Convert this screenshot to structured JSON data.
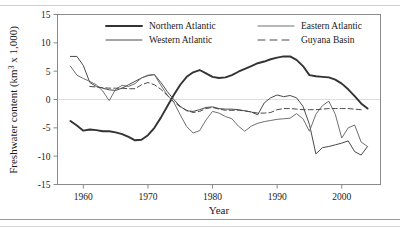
{
  "figure": {
    "axis_titles": {
      "x": "Year",
      "y_full": "Freshwater content (km3 x 1,000)",
      "y_pre": "Freshwater content (km",
      "y_sup": "3",
      "y_post": " x 1,000)"
    }
  },
  "chart_data": {
    "type": "line",
    "title": "",
    "xlabel": "Year",
    "ylabel": "Freshwater content (km3 x 1,000)",
    "xlim": [
      1956,
      2006
    ],
    "ylim": [
      -15,
      15
    ],
    "xticks": [
      1960,
      1970,
      1980,
      1990,
      2000
    ],
    "xtick_labels": [
      "1960",
      "1970",
      "1980",
      "1990",
      "2000"
    ],
    "yticks": [
      15,
      10,
      5,
      0,
      -5,
      -10,
      -15
    ],
    "ytick_labels": [
      "15",
      "10",
      "5",
      "0",
      "-5",
      "-10",
      "-15"
    ],
    "grid": "zero-line-only",
    "legend_position": "top-inside-two-columns",
    "series": [
      {
        "name": "Northern Atlantic",
        "style": "solid",
        "color": "#333333",
        "width": 1.9,
        "x": [
          1958,
          1959,
          1960,
          1961,
          1962,
          1963,
          1964,
          1965,
          1966,
          1967,
          1968,
          1969,
          1970,
          1971,
          1972,
          1973,
          1974,
          1975,
          1976,
          1977,
          1978,
          1979,
          1980,
          1981,
          1982,
          1983,
          1984,
          1985,
          1986,
          1987,
          1988,
          1989,
          1990,
          1991,
          1992,
          1993,
          1994,
          1995,
          1996,
          1997,
          1998,
          1999,
          2000,
          2001,
          2002,
          2003,
          2004
        ],
        "y": [
          -3.8,
          -4.6,
          -5.5,
          -5.3,
          -5.4,
          -5.6,
          -5.6,
          -5.8,
          -6.1,
          -6.6,
          -7.2,
          -7.1,
          -6.3,
          -5.0,
          -3.2,
          -1.2,
          0.8,
          2.6,
          4.0,
          4.8,
          5.2,
          4.6,
          4.0,
          3.8,
          3.9,
          4.3,
          4.9,
          5.4,
          5.9,
          6.4,
          6.7,
          7.1,
          7.4,
          7.6,
          7.6,
          7.0,
          5.9,
          4.3,
          4.1,
          4.0,
          3.9,
          3.5,
          2.8,
          1.8,
          0.6,
          -0.7,
          -1.6
        ]
      },
      {
        "name": "Western Atlantic",
        "style": "solid",
        "color": "#4a4a4a",
        "width": 1.0,
        "x": [
          1958,
          1959,
          1960,
          1961,
          1962,
          1963,
          1964,
          1965,
          1966,
          1967,
          1968,
          1969,
          1970,
          1971,
          1972,
          1973,
          1974,
          1975,
          1976,
          1977,
          1978,
          1979,
          1980,
          1981,
          1982,
          1983,
          1984,
          1985,
          1986,
          1987,
          1988,
          1989,
          1990,
          1991,
          1992,
          1993,
          1994,
          1995,
          1996,
          1997,
          1998,
          1999,
          2000,
          2001,
          2002,
          2003,
          2004
        ],
        "y": [
          7.6,
          7.6,
          6.0,
          3.0,
          2.3,
          2.0,
          1.7,
          1.6,
          2.0,
          2.6,
          3.2,
          3.8,
          4.2,
          4.4,
          3.0,
          1.4,
          0.0,
          -1.2,
          -2.0,
          -2.1,
          -1.8,
          -1.4,
          -1.3,
          -1.6,
          -1.7,
          -1.7,
          -1.8,
          -2.0,
          -2.2,
          -2.7,
          -0.6,
          0.3,
          0.8,
          0.5,
          0.7,
          0.3,
          -1.2,
          -4.4,
          -9.6,
          -8.5,
          -8.3,
          -8.0,
          -7.7,
          -7.3,
          -9.2,
          -9.8,
          -8.3
        ]
      },
      {
        "name": "Eastern Atlantic",
        "style": "solid",
        "color": "#6f6f6f",
        "width": 1.0,
        "x": [
          1958,
          1959,
          1960,
          1961,
          1962,
          1963,
          1964,
          1965,
          1966,
          1967,
          1968,
          1969,
          1970,
          1971,
          1972,
          1973,
          1974,
          1975,
          1976,
          1977,
          1978,
          1979,
          1980,
          1981,
          1982,
          1983,
          1984,
          1985,
          1986,
          1987,
          1988,
          1989,
          1990,
          1991,
          1992,
          1993,
          1994,
          1995,
          1996,
          1997,
          1998,
          1999,
          2000,
          2001,
          2002,
          2003,
          2004
        ],
        "y": [
          5.9,
          4.3,
          3.7,
          3.2,
          2.6,
          1.5,
          -0.2,
          1.8,
          2.5,
          2.3,
          2.8,
          3.8,
          4.3,
          4.4,
          2.5,
          0.8,
          -0.5,
          -2.7,
          -4.8,
          -5.9,
          -5.5,
          -3.6,
          -2.1,
          -2.4,
          -3.0,
          -3.4,
          -4.7,
          -5.6,
          -4.7,
          -4.2,
          -3.9,
          -3.7,
          -3.5,
          -3.4,
          -3.3,
          -2.5,
          -3.4,
          -5.6,
          -2.6,
          -1.1,
          -0.3,
          -2.6,
          -6.8,
          -5.0,
          -4.5,
          -7.5,
          -8.3
        ]
      },
      {
        "name": "Guyana Basin",
        "style": "dashed",
        "color": "#4a4a4a",
        "width": 1.0,
        "x": [
          1961,
          1962,
          1963,
          1964,
          1965,
          1966,
          1967,
          1968,
          1969,
          1970,
          1971,
          1972,
          1973,
          1974,
          1975,
          1976,
          1977,
          1978,
          1979,
          1980,
          1981,
          1982,
          1983,
          1984,
          1985,
          1986,
          1987,
          1988,
          1989,
          1990,
          1991,
          1992,
          1993,
          1994,
          1995,
          1996,
          1997,
          1998,
          1999,
          2000,
          2001,
          2002,
          2003
        ],
        "y": [
          2.3,
          2.2,
          2.1,
          2.0,
          2.0,
          2.0,
          1.9,
          1.9,
          2.6,
          3.0,
          2.6,
          1.8,
          0.7,
          -0.4,
          -1.3,
          -1.9,
          -2.3,
          -2.1,
          -1.6,
          -1.4,
          -1.7,
          -1.9,
          -1.9,
          -1.9,
          -2.0,
          -2.2,
          -2.4,
          -2.4,
          -2.3,
          -1.8,
          -1.6,
          -1.6,
          -1.7,
          -1.8,
          -1.8,
          -1.8,
          -1.7,
          -1.6,
          -1.6,
          -1.6,
          -1.6,
          -1.7,
          -1.8
        ]
      }
    ],
    "legend": [
      {
        "name": "Northern Atlantic",
        "style": "solid",
        "color": "#333333",
        "width": 1.9
      },
      {
        "name": "Eastern Atlantic",
        "style": "solid",
        "color": "#6f6f6f",
        "width": 1.0
      },
      {
        "name": "Western Atlantic",
        "style": "solid",
        "color": "#4a4a4a",
        "width": 1.0
      },
      {
        "name": "Guyana Basin",
        "style": "dashed",
        "color": "#4a4a4a",
        "width": 1.0
      }
    ]
  }
}
